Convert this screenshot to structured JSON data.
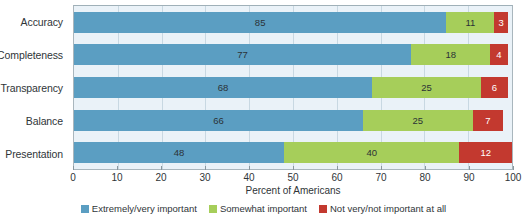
{
  "chart_data": {
    "type": "bar",
    "orientation": "horizontal",
    "stacked": true,
    "title": "",
    "xlabel": "Percent of Americans",
    "ylabel": "",
    "xlim": [
      0,
      100
    ],
    "xticks": [
      0,
      10,
      20,
      30,
      40,
      50,
      60,
      70,
      80,
      90,
      100
    ],
    "grid": "vertical",
    "legend_position": "bottom",
    "categories": [
      "Accuracy",
      "Completeness",
      "Transparency",
      "Balance",
      "Presentation"
    ],
    "series": [
      {
        "name": "Extremely/very important",
        "color": "#5b9ec2",
        "values": [
          85,
          77,
          68,
          66,
          48
        ]
      },
      {
        "name": "Somewhat important",
        "color": "#a6ce5a",
        "values": [
          11,
          18,
          25,
          25,
          40
        ]
      },
      {
        "name": "Not very/not important at all",
        "color": "#c3392f",
        "values": [
          3,
          4,
          6,
          7,
          12
        ]
      }
    ],
    "bar_labels": [
      [
        "85",
        "11",
        "3"
      ],
      [
        "77",
        "18",
        "4"
      ],
      [
        "68",
        "25",
        "6"
      ],
      [
        "66",
        "25",
        "7"
      ],
      [
        "48",
        "40",
        "12"
      ]
    ]
  },
  "colors": {
    "plot_background": "#eaf2f8",
    "gridline": "#c8d8e2",
    "axis": "#a9b6bd",
    "text": "#2f3538",
    "series_1": "#5b9ec2",
    "series_2": "#a6ce5a",
    "series_3": "#c3392f"
  }
}
